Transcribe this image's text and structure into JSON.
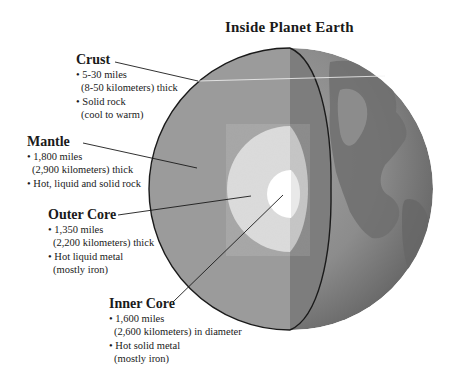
{
  "title": "Inside Planet Earth",
  "colors": {
    "background": "#ffffff",
    "mantle": "#9b9b9b",
    "cut_face": "#7d7d7d",
    "surface": "#8a8a8a",
    "outer_core": "#d9d9d9",
    "inner_core": "#ffffff",
    "outline": "#1a1a1a"
  },
  "layers": [
    {
      "id": "crust",
      "name": "Crust",
      "lines": [
        "• 5-30 miles",
        "(8-50 kilometers) thick",
        "• Solid rock",
        "(cool to warm)"
      ]
    },
    {
      "id": "mantle",
      "name": "Mantle",
      "lines": [
        "• 1,800 miles",
        "(2,900 kilometers) thick",
        "• Hot, liquid and solid rock"
      ]
    },
    {
      "id": "outer_core",
      "name": "Outer Core",
      "lines": [
        "• 1,350 miles",
        "(2,200 kilometers) thick",
        "• Hot liquid metal",
        "(mostly iron)"
      ]
    },
    {
      "id": "inner_core",
      "name": "Inner Core",
      "lines": [
        "• 1,600 miles",
        "(2,600 kilometers) in diameter",
        "• Hot solid metal",
        "(mostly iron)"
      ]
    }
  ]
}
